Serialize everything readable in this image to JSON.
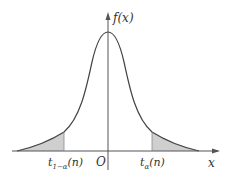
{
  "diagram": {
    "y_axis_label": "f(x)",
    "x_axis_label": "x",
    "origin_label": "O",
    "left_quantile_label": {
      "main": "t",
      "sub": "1−α",
      "arg": "(n)"
    },
    "right_quantile_label": {
      "main": "t",
      "sub": "α",
      "arg": "(n)"
    },
    "colors": {
      "curve": "#444444",
      "axis": "#555555",
      "shade": "#cfcfcf"
    }
  }
}
